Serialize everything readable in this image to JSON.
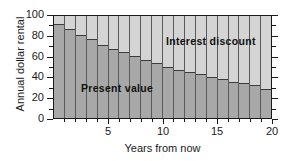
{
  "chart_data": {
    "type": "bar",
    "title": "",
    "subtitle": "",
    "xlabel": "Years from now",
    "ylabel": "Annual dollar rental",
    "xlim": [
      0,
      20
    ],
    "ylim": [
      0,
      100
    ],
    "grid": false,
    "stacked": true,
    "legend_position": "inside-plot-annotations",
    "x_tick_labels": [
      "5",
      "10",
      "15",
      "20"
    ],
    "x_tick_values": [
      5,
      10,
      15,
      20
    ],
    "x_minor_tick_values": [
      1,
      2,
      3,
      4,
      6,
      7,
      8,
      9,
      11,
      12,
      13,
      14,
      16,
      17,
      18,
      19
    ],
    "y_tick_labels": [
      "0",
      "20",
      "40",
      "60",
      "80",
      "100"
    ],
    "y_tick_values": [
      0,
      20,
      40,
      60,
      80,
      100
    ],
    "y_minor_tick_values": [
      10,
      30,
      50,
      70,
      90
    ],
    "categories": [
      1,
      2,
      3,
      4,
      5,
      6,
      7,
      8,
      9,
      10,
      11,
      12,
      13,
      14,
      15,
      16,
      17,
      18,
      19,
      20
    ],
    "series": [
      {
        "name": "Present value",
        "color": "#a8a8a8",
        "values": [
          92,
          87,
          81,
          77,
          72,
          68,
          65,
          61,
          57,
          54,
          50,
          47,
          45,
          43,
          40,
          38,
          35,
          34,
          32,
          28
        ]
      },
      {
        "name": "Interest discount",
        "color": "#d4d4d4",
        "values": [
          8,
          13,
          19,
          23,
          28,
          32,
          35,
          39,
          43,
          46,
          50,
          53,
          55,
          57,
          60,
          62,
          65,
          66,
          68,
          72
        ]
      }
    ],
    "annotations": [
      {
        "text": "Interest discount",
        "x": 13.5,
        "y": 85
      },
      {
        "text": "Present value",
        "x": 4.5,
        "y": 39
      }
    ]
  },
  "colors": {
    "axis": "#1a1a1a",
    "present_value": "#a8a8a8",
    "interest_discount": "#d4d4d4",
    "bar_divider": "#5a5a5a",
    "background": "#ffffff"
  }
}
